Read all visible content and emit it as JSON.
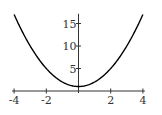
{
  "chart_data": {
    "type": "line",
    "title": "",
    "xlabel": "",
    "ylabel": "",
    "function": "y = x^2 + 1",
    "xlim": [
      -4,
      4
    ],
    "ylim": [
      0,
      17.5
    ],
    "x_ticks": [
      -4,
      -2,
      2,
      4
    ],
    "x_tick_labels": [
      "-4",
      "-2",
      "2",
      "4"
    ],
    "y_ticks": [
      5,
      10,
      15
    ],
    "y_tick_labels": [
      "5",
      "10",
      "15"
    ],
    "grid": false,
    "legend": null,
    "series": [
      {
        "name": "y = x^2 + 1",
        "color": "#000000",
        "x": [
          -4,
          -3.5,
          -3,
          -2.5,
          -2,
          -1.5,
          -1,
          -0.5,
          0,
          0.5,
          1,
          1.5,
          2,
          2.5,
          3,
          3.5,
          4
        ],
        "y": [
          17,
          13.25,
          10,
          7.25,
          5,
          3.25,
          2,
          1.25,
          1,
          1.25,
          2,
          3.25,
          5,
          7.25,
          10,
          13.25,
          17
        ]
      }
    ]
  },
  "colors": {
    "axis": "#333333",
    "curve": "#000000",
    "background": "#ffffff"
  }
}
